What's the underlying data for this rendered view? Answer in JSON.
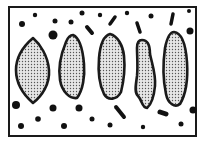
{
  "diagram": {
    "frame": {
      "x": 9,
      "y": 7,
      "width": 187,
      "height": 129,
      "stroke": "#1a1a1a"
    },
    "colors": {
      "outline": "#1a1a1a",
      "fill": "#d9d9d9",
      "stipple": "#4a4a4a",
      "particle": "#111111",
      "background": "#ffffff"
    },
    "elongated_bodies": [
      {
        "id": "body-1",
        "path": "M33,38 C40,44 48,56 49,70 C50,84 42,96 33,103 C25,96 16,86 16,70 C16,55 26,44 33,38 Z"
      },
      {
        "id": "body-2",
        "path": "M73,35 C80,38 83,52 84,64 C85,76 83,90 77,98 C70,99 62,92 60,80 C58,68 61,54 66,42 C68,37 70,35 73,35 Z"
      },
      {
        "id": "body-3",
        "path": "M110,34 C118,36 123,46 124,56 C125,66 124,80 121,92 C117,100 108,101 104,94 C99,84 98,70 99,58 C100,46 103,36 110,34 Z"
      },
      {
        "id": "body-4",
        "path": "M142,40 C148,40 150,46 150,54 C152,64 156,74 155,86 C154,96 152,104 147,108 C142,108 142,100 138,96 C134,92 136,84 137,76 C138,66 137,56 137,48 C137,43 139,40 142,40 Z"
      },
      {
        "id": "body-5",
        "path": "M174,32 C183,33 186,48 187,62 C188,78 186,94 180,104 C175,108 168,104 166,94 C163,80 163,62 165,48 C167,38 170,32 174,32 Z"
      }
    ],
    "particles": [
      {
        "cx": 22,
        "cy": 24,
        "r": 3
      },
      {
        "cx": 35,
        "cy": 15,
        "r": 2.2
      },
      {
        "cx": 55,
        "cy": 21,
        "r": 2.5
      },
      {
        "cx": 71,
        "cy": 22,
        "r": 2.5
      },
      {
        "cx": 82,
        "cy": 13,
        "r": 2.5
      },
      {
        "cx": 53,
        "cy": 35,
        "r": 4.5
      },
      {
        "cx": 100,
        "cy": 15,
        "r": 2.2
      },
      {
        "cx": 127,
        "cy": 13,
        "r": 2.2
      },
      {
        "cx": 151,
        "cy": 16,
        "r": 2.5
      },
      {
        "cx": 189,
        "cy": 11,
        "r": 2
      },
      {
        "cx": 190,
        "cy": 31,
        "r": 3.5
      },
      {
        "cx": 16,
        "cy": 105,
        "r": 4
      },
      {
        "cx": 53,
        "cy": 108,
        "r": 3.5
      },
      {
        "cx": 79,
        "cy": 108,
        "r": 3.5
      },
      {
        "cx": 38,
        "cy": 119,
        "r": 2.8
      },
      {
        "cx": 21,
        "cy": 126,
        "r": 3
      },
      {
        "cx": 64,
        "cy": 126,
        "r": 3
      },
      {
        "cx": 92,
        "cy": 119,
        "r": 2.5
      },
      {
        "cx": 110,
        "cy": 125,
        "r": 2.5
      },
      {
        "cx": 143,
        "cy": 127,
        "r": 2.2
      },
      {
        "cx": 181,
        "cy": 124,
        "r": 2.5
      },
      {
        "cx": 193,
        "cy": 110,
        "r": 3.5
      }
    ],
    "rods": [
      {
        "x1": 87,
        "y1": 27,
        "x2": 92,
        "y2": 33,
        "w": 4
      },
      {
        "x1": 110,
        "y1": 24,
        "x2": 115,
        "y2": 17,
        "w": 3.5
      },
      {
        "x1": 137,
        "y1": 23,
        "x2": 140,
        "y2": 32,
        "w": 3.5
      },
      {
        "x1": 171,
        "y1": 24,
        "x2": 173,
        "y2": 14,
        "w": 3.5
      },
      {
        "x1": 116,
        "y1": 107,
        "x2": 124,
        "y2": 117,
        "w": 4
      },
      {
        "x1": 160,
        "y1": 112,
        "x2": 166,
        "y2": 114,
        "w": 5
      }
    ]
  }
}
